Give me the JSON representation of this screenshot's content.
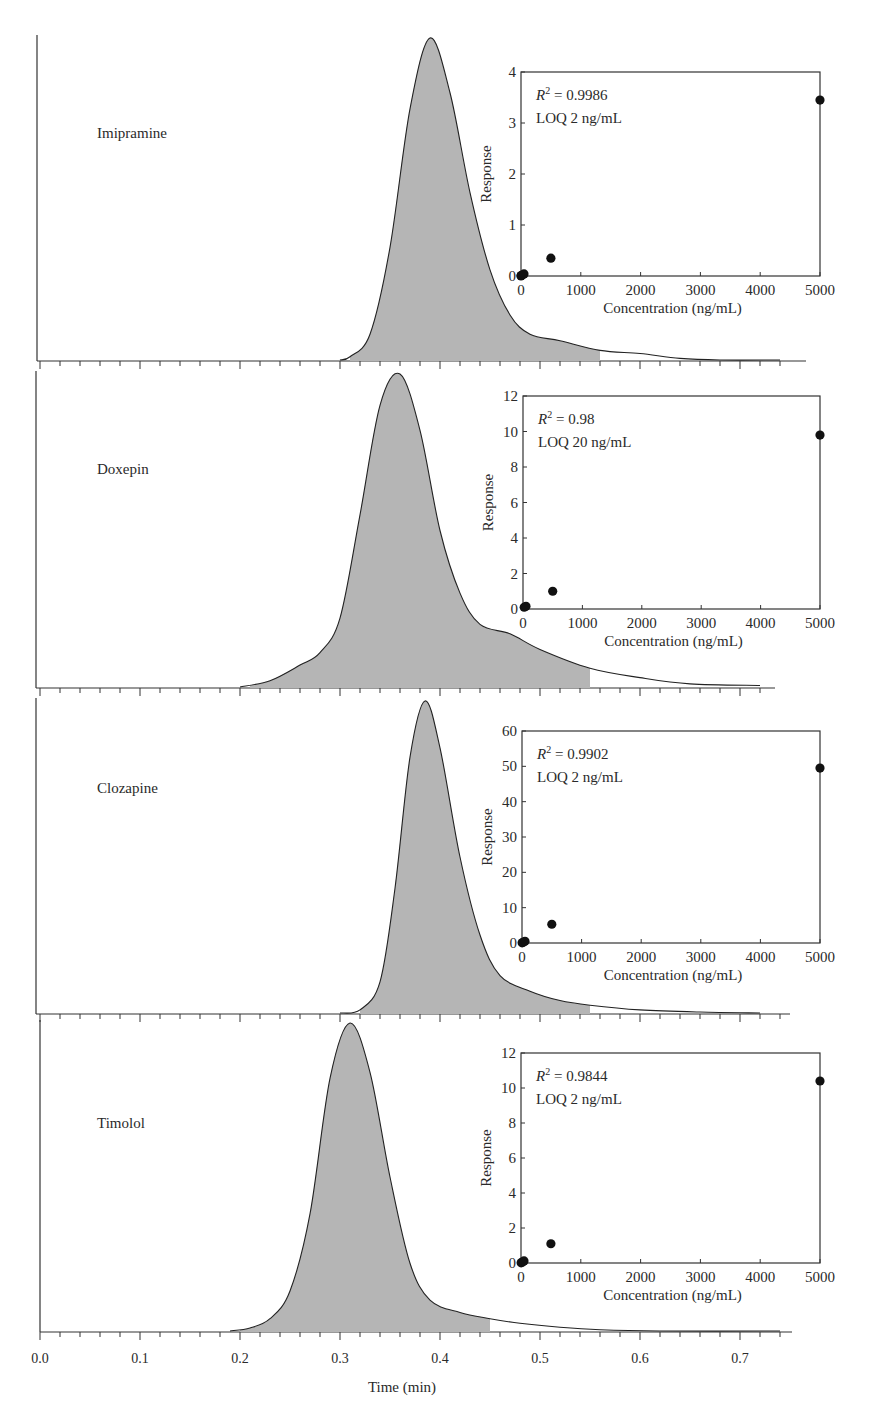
{
  "chart_data": [
    {
      "type": "area",
      "title": "Chromatograms",
      "xlabel": "Time (min)",
      "ylabel": "",
      "xlim": [
        0.0,
        0.75
      ],
      "xticks": [
        "0.0",
        "0.1",
        "0.2",
        "0.3",
        "0.4",
        "0.5",
        "0.6",
        "0.7"
      ],
      "grid": false,
      "series": [
        {
          "name": "Imipramine",
          "peak_time": 0.39,
          "shaded_range": [
            0.31,
            0.56
          ],
          "x": [
            0.3,
            0.31,
            0.33,
            0.35,
            0.37,
            0.39,
            0.41,
            0.43,
            0.45,
            0.47,
            0.49,
            0.52,
            0.56,
            0.6,
            0.64,
            0.68,
            0.74
          ],
          "y": [
            0,
            0.01,
            0.08,
            0.35,
            0.78,
            1.0,
            0.83,
            0.52,
            0.28,
            0.14,
            0.08,
            0.06,
            0.03,
            0.02,
            0.005,
            0,
            0
          ]
        },
        {
          "name": "Doxepin",
          "peak_time": 0.36,
          "shaded_range": [
            0.21,
            0.55
          ],
          "x": [
            0.2,
            0.23,
            0.26,
            0.28,
            0.3,
            0.32,
            0.34,
            0.36,
            0.38,
            0.4,
            0.42,
            0.44,
            0.47,
            0.5,
            0.55,
            0.6,
            0.65,
            0.72
          ],
          "y": [
            0,
            0.02,
            0.07,
            0.11,
            0.22,
            0.55,
            0.9,
            1.0,
            0.82,
            0.5,
            0.3,
            0.2,
            0.17,
            0.12,
            0.06,
            0.03,
            0.01,
            0.005
          ]
        },
        {
          "name": "Clozapine",
          "peak_time": 0.385,
          "shaded_range": [
            0.32,
            0.55
          ],
          "x": [
            0.3,
            0.32,
            0.34,
            0.355,
            0.37,
            0.385,
            0.4,
            0.42,
            0.44,
            0.46,
            0.49,
            0.52,
            0.55,
            0.6,
            0.66,
            0.72
          ],
          "y": [
            0,
            0.01,
            0.1,
            0.4,
            0.82,
            1.0,
            0.85,
            0.5,
            0.25,
            0.12,
            0.07,
            0.04,
            0.025,
            0.01,
            0.003,
            0
          ]
        },
        {
          "name": "Timolol",
          "peak_time": 0.31,
          "shaded_range": [
            0.2,
            0.45
          ],
          "x": [
            0.19,
            0.21,
            0.23,
            0.25,
            0.27,
            0.29,
            0.31,
            0.33,
            0.35,
            0.37,
            0.39,
            0.42,
            0.45,
            0.48,
            0.52,
            0.56,
            0.62,
            0.74
          ],
          "y": [
            0,
            0.01,
            0.04,
            0.13,
            0.38,
            0.82,
            1.0,
            0.84,
            0.5,
            0.22,
            0.1,
            0.06,
            0.04,
            0.025,
            0.012,
            0.004,
            0,
            0
          ]
        }
      ]
    },
    {
      "type": "scatter",
      "title": "Imipramine calibration",
      "annotation_r2": "= 0.9986",
      "annotation_loq": "LOQ 2 ng/mL",
      "xlabel": "Concentration (ng/mL)",
      "ylabel": "Response",
      "xlim": [
        0,
        5000
      ],
      "ylim": [
        0,
        4
      ],
      "xticks": [
        "0",
        "1000",
        "2000",
        "3000",
        "4000",
        "5000"
      ],
      "yticks": [
        "0",
        "1",
        "2",
        "3",
        "4"
      ],
      "x": [
        0,
        2,
        20,
        50,
        500,
        5000
      ],
      "y": [
        0.0,
        0.01,
        0.02,
        0.04,
        0.35,
        3.45
      ]
    },
    {
      "type": "scatter",
      "title": "Doxepin calibration",
      "annotation_r2": "= 0.98",
      "annotation_loq": "LOQ 20 ng/mL",
      "xlabel": "Concentration (ng/mL)",
      "ylabel": "Response",
      "xlim": [
        0,
        5000
      ],
      "ylim": [
        0,
        12
      ],
      "xticks": [
        "0",
        "1000",
        "2000",
        "3000",
        "4000",
        "5000"
      ],
      "yticks": [
        "0",
        "2",
        "4",
        "6",
        "8",
        "10",
        "12"
      ],
      "x": [
        20,
        50,
        500,
        5000
      ],
      "y": [
        0.1,
        0.15,
        1.0,
        9.8
      ]
    },
    {
      "type": "scatter",
      "title": "Clozapine calibration",
      "annotation_r2": "= 0.9902",
      "annotation_loq": "LOQ 2 ng/mL",
      "xlabel": "Concentration (ng/mL)",
      "ylabel": "Response",
      "xlim": [
        0,
        5000
      ],
      "ylim": [
        0,
        60
      ],
      "xticks": [
        "0",
        "1000",
        "2000",
        "3000",
        "4000",
        "5000"
      ],
      "yticks": [
        "0",
        "10",
        "20",
        "30",
        "40",
        "50",
        "60"
      ],
      "x": [
        2,
        20,
        50,
        500,
        5000
      ],
      "y": [
        0.05,
        0.2,
        0.5,
        5.3,
        49.5
      ]
    },
    {
      "type": "scatter",
      "title": "Timolol calibration",
      "annotation_r2": "= 0.9844",
      "annotation_loq": "LOQ 2 ng/mL",
      "xlabel": "Concentration (ng/mL)",
      "ylabel": "Response",
      "xlim": [
        0,
        5000
      ],
      "ylim": [
        0,
        12
      ],
      "xticks": [
        "0",
        "1000",
        "2000",
        "3000",
        "4000",
        "5000"
      ],
      "yticks": [
        "0",
        "2",
        "4",
        "6",
        "8",
        "10",
        "12"
      ],
      "x": [
        2,
        20,
        50,
        500,
        5000
      ],
      "y": [
        0.01,
        0.05,
        0.12,
        1.1,
        10.4
      ]
    }
  ],
  "labels": {
    "compounds": [
      "Imipramine",
      "Doxepin",
      "Clozapine",
      "Timolol"
    ],
    "r2_symbol": "R",
    "r2_sup": "2",
    "time_axis_label": "Time (min)",
    "response_label": "Response",
    "concentration_label": "Concentration (ng/mL)"
  }
}
